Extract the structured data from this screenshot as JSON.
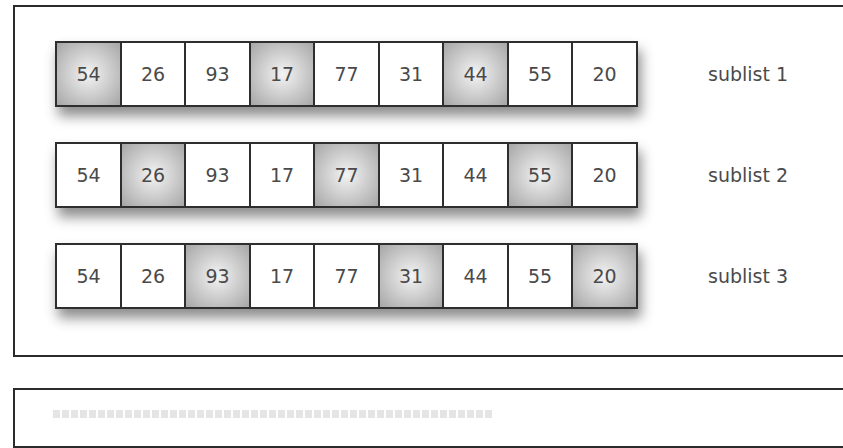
{
  "diagram": {
    "sublists": [
      {
        "label": "sublist 1",
        "cells": [
          {
            "value": "54",
            "highlighted": true
          },
          {
            "value": "26",
            "highlighted": false
          },
          {
            "value": "93",
            "highlighted": false
          },
          {
            "value": "17",
            "highlighted": true
          },
          {
            "value": "77",
            "highlighted": false
          },
          {
            "value": "31",
            "highlighted": false
          },
          {
            "value": "44",
            "highlighted": true
          },
          {
            "value": "55",
            "highlighted": false
          },
          {
            "value": "20",
            "highlighted": false
          }
        ]
      },
      {
        "label": "sublist 2",
        "cells": [
          {
            "value": "54",
            "highlighted": false
          },
          {
            "value": "26",
            "highlighted": true
          },
          {
            "value": "93",
            "highlighted": false
          },
          {
            "value": "17",
            "highlighted": false
          },
          {
            "value": "77",
            "highlighted": true
          },
          {
            "value": "31",
            "highlighted": false
          },
          {
            "value": "44",
            "highlighted": false
          },
          {
            "value": "55",
            "highlighted": true
          },
          {
            "value": "20",
            "highlighted": false
          }
        ]
      },
      {
        "label": "sublist 3",
        "cells": [
          {
            "value": "54",
            "highlighted": false
          },
          {
            "value": "26",
            "highlighted": false
          },
          {
            "value": "93",
            "highlighted": true
          },
          {
            "value": "17",
            "highlighted": false
          },
          {
            "value": "77",
            "highlighted": false
          },
          {
            "value": "31",
            "highlighted": true
          },
          {
            "value": "44",
            "highlighted": false
          },
          {
            "value": "55",
            "highlighted": false
          },
          {
            "value": "20",
            "highlighted": true
          }
        ]
      }
    ],
    "colors": {
      "border": "#2e2e2e",
      "text": "#4a4a4a",
      "highlight": "#b5b5b5",
      "cell_background": "#ffffff"
    }
  }
}
